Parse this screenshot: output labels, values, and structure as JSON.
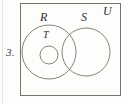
{
  "figure": {
    "kind": "venn-diagram",
    "item_number": "3.",
    "universal_set_label": "U",
    "sets": [
      {
        "name": "R",
        "label": "R",
        "shape": "circle",
        "cx": 49,
        "cy": 52,
        "r": 27
      },
      {
        "name": "S",
        "label": "S",
        "shape": "circle",
        "cx": 86,
        "cy": 52,
        "r": 24
      },
      {
        "name": "T",
        "label": "T",
        "shape": "circle",
        "cx": 49,
        "cy": 55,
        "r": 9
      }
    ],
    "relations": [
      "T is a subset of R",
      "R and S intersect",
      "T is disjoint from S",
      "R, S and T are all inside U"
    ],
    "stroke_color": "#767570",
    "label_color": "#2e2e2c",
    "background_color": "#fdfdfc"
  }
}
